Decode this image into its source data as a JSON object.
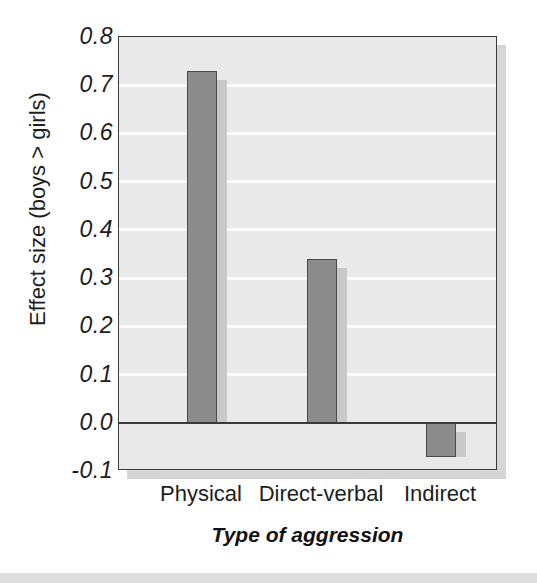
{
  "chart_data": {
    "type": "bar",
    "title": "",
    "xlabel": "Type of aggression",
    "ylabel": "Effect size (boys > girls)",
    "categories": [
      "Physical",
      "Direct-verbal",
      "Indirect"
    ],
    "values": [
      0.73,
      0.34,
      -0.07
    ],
    "ylim": [
      -0.1,
      0.8
    ],
    "ytick_labels": [
      "0.8",
      "0.7",
      "0.6",
      "0.5",
      "0.4",
      "0.3",
      "0.2",
      "0.1",
      "0.0",
      "-0.1"
    ],
    "ytick_values": [
      0.8,
      0.7,
      0.6,
      0.5,
      0.4,
      0.3,
      0.2,
      0.1,
      0.0,
      -0.1
    ],
    "grid": true,
    "legend": "none",
    "series": [
      {
        "name": "Effect size",
        "values": [
          0.73,
          0.34,
          -0.07
        ]
      }
    ],
    "colors": {
      "bar_fill": "#8c8c8c",
      "bar_border": "#4a4a4a",
      "bar_shadow": "#c9c9c9",
      "plot_background": "#e9e9e9",
      "gridline": "#fbfbfb",
      "axis": "#3a3a3a",
      "text": "#1d1d1d",
      "figure_shadow": "#d6d6d6",
      "bottom_strip": "#dddddd"
    }
  }
}
